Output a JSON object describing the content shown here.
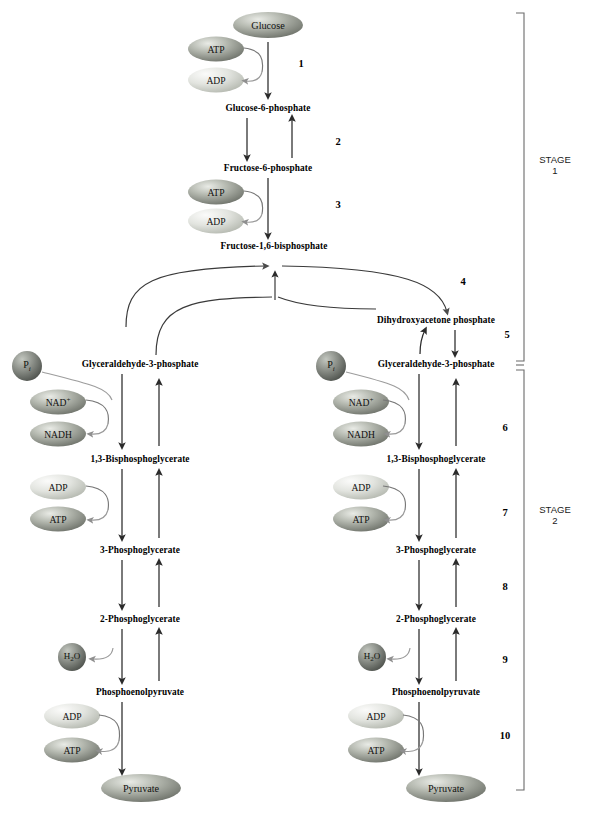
{
  "figure": {
    "stages": [
      {
        "label": "STAGE",
        "number": "1"
      },
      {
        "label": "STAGE",
        "number": "2"
      }
    ],
    "step_numbers": [
      "1",
      "2",
      "3",
      "4",
      "5",
      "6",
      "7",
      "8",
      "9",
      "10"
    ]
  },
  "colors": {
    "line": "#3a3a3a",
    "arrow": "#2b2b2b",
    "bracket": "#6b6b6b",
    "bubble_light_a": "#f2f2f2",
    "bubble_light_b": "#b9bdb4",
    "bubble_dark_a": "#d8dad4",
    "bubble_dark_b": "#6f736a",
    "circle_a": "#9aa09a",
    "circle_b": "#4e524d",
    "text": "#000000"
  },
  "metabolites": {
    "glucose": "Glucose",
    "g6p": "Glucose-6-phosphate",
    "f6p": "Fructose-6-phosphate",
    "f16bp": "Fructose-1,6-bisphosphate",
    "dhap": "Dihydroxyacetone phosphate",
    "g3p": "Glyceraldehyde-3-phosphate",
    "bpg13": "1,3-Bisphosphoglycerate",
    "pg3": "3-Phosphoglycerate",
    "pg2": "2-Phosphoglycerate",
    "pep": "Phosphoenolpyruvate",
    "pyruvate": "Pyruvate"
  },
  "cofactors": {
    "atp": "ATP",
    "adp": "ADP",
    "nad_plus": "NAD+",
    "nadh": "NADH",
    "pi": "Pi",
    "water": "H2O"
  },
  "upper_chain": [
    {
      "id": "glucose",
      "name": "Glucose",
      "kind": "bubble",
      "x": 268,
      "y": 25,
      "rx": 35,
      "ry": 13,
      "shade": "dark"
    },
    {
      "id": "g6p",
      "name": "Glucose-6-phosphate",
      "kind": "text",
      "x": 268,
      "y": 108
    },
    {
      "id": "f6p",
      "name": "Fructose-6-phosphate",
      "kind": "text",
      "x": 268,
      "y": 168
    },
    {
      "id": "f16bp",
      "name": "Fructose-1,6-bisphosphate",
      "kind": "text",
      "x": 274,
      "y": 246
    }
  ],
  "branch": {
    "dhap": {
      "name": "Dihydroxyacetone phosphate",
      "x": 436,
      "y": 320
    },
    "g3p_left": {
      "name": "Glyceraldehyde-3-phosphate",
      "x": 140,
      "y": 364
    },
    "g3p_right": {
      "name": "Glyceraldehyde-3-phosphate",
      "x": 436,
      "y": 364
    }
  },
  "lower_chain_left": [
    {
      "id": "bpg13",
      "name": "1,3-Bisphosphoglycerate",
      "x": 140,
      "y": 459
    },
    {
      "id": "pg3",
      "name": "3-Phosphoglycerate",
      "x": 140,
      "y": 550
    },
    {
      "id": "pg2",
      "name": "2-Phosphoglycerate",
      "x": 140,
      "y": 619
    },
    {
      "id": "pep",
      "name": "Phosphoenolpyruvate",
      "x": 140,
      "y": 692
    },
    {
      "id": "pyruvate",
      "name": "Pyruvate",
      "x": 141,
      "y": 788
    }
  ],
  "lower_chain_right": [
    {
      "id": "bpg13",
      "name": "1,3-Bisphosphoglycerate",
      "x": 436,
      "y": 459
    },
    {
      "id": "pg3",
      "name": "3-Phosphoglycerate",
      "x": 436,
      "y": 550
    },
    {
      "id": "pg2",
      "name": "2-Phosphoglycerate",
      "x": 436,
      "y": 619
    },
    {
      "id": "pep",
      "name": "Phosphoenolpyruvate",
      "x": 436,
      "y": 692
    },
    {
      "id": "pyruvate",
      "name": "Pyruvate",
      "x": 446,
      "y": 788
    }
  ],
  "bubbles": [
    {
      "id": "atp-1",
      "label": "ATP",
      "x": 216,
      "y": 49,
      "shade": "dark"
    },
    {
      "id": "adp-1",
      "label": "ADP",
      "x": 216,
      "y": 80,
      "shade": "light"
    },
    {
      "id": "atp-3",
      "label": "ATP",
      "x": 216,
      "y": 192,
      "shade": "dark"
    },
    {
      "id": "adp-3",
      "label": "ADP",
      "x": 216,
      "y": 221,
      "shade": "light"
    },
    {
      "id": "nadp-L",
      "label": "NAD+",
      "x": 58,
      "y": 402,
      "shade": "dark"
    },
    {
      "id": "nadh-L",
      "label": "NADH",
      "x": 58,
      "y": 434,
      "shade": "dark"
    },
    {
      "id": "adp-L7",
      "label": "ADP",
      "x": 58,
      "y": 487,
      "shade": "light"
    },
    {
      "id": "atp-L7",
      "label": "ATP",
      "x": 58,
      "y": 519,
      "shade": "dark"
    },
    {
      "id": "adp-L10",
      "label": "ADP",
      "x": 72,
      "y": 716,
      "shade": "light"
    },
    {
      "id": "atp-L10",
      "label": "ATP",
      "x": 72,
      "y": 750,
      "shade": "dark"
    },
    {
      "id": "nadp-R",
      "label": "NAD+",
      "x": 361,
      "y": 402,
      "shade": "dark"
    },
    {
      "id": "nadh-R",
      "label": "NADH",
      "x": 361,
      "y": 434,
      "shade": "dark"
    },
    {
      "id": "adp-R7",
      "label": "ADP",
      "x": 361,
      "y": 487,
      "shade": "light"
    },
    {
      "id": "atp-R7",
      "label": "ATP",
      "x": 361,
      "y": 519,
      "shade": "dark"
    },
    {
      "id": "adp-R10",
      "label": "ADP",
      "x": 376,
      "y": 716,
      "shade": "light"
    },
    {
      "id": "atp-R10",
      "label": "ATP",
      "x": 376,
      "y": 750,
      "shade": "dark"
    }
  ],
  "circles": [
    {
      "id": "pi-left",
      "label": "Pi",
      "x": 27,
      "y": 366,
      "r": 15
    },
    {
      "id": "pi-right",
      "label": "Pi",
      "x": 331,
      "y": 366,
      "r": 15
    },
    {
      "id": "h2o-left",
      "label": "H2O",
      "x": 72,
      "y": 657,
      "r": 14
    },
    {
      "id": "h2o-right",
      "label": "H2O",
      "x": 372,
      "y": 657,
      "r": 14
    }
  ],
  "step_label_positions": [
    {
      "n": "1",
      "x": 301,
      "y": 63
    },
    {
      "n": "2",
      "x": 338,
      "y": 141
    },
    {
      "n": "3",
      "x": 338,
      "y": 204
    },
    {
      "n": "4",
      "x": 463,
      "y": 281
    },
    {
      "n": "5",
      "x": 507,
      "y": 334
    },
    {
      "n": "6",
      "x": 505,
      "y": 427
    },
    {
      "n": "7",
      "x": 505,
      "y": 512
    },
    {
      "n": "8",
      "x": 505,
      "y": 586
    },
    {
      "n": "9",
      "x": 505,
      "y": 659
    },
    {
      "n": "10",
      "x": 505,
      "y": 735
    }
  ],
  "stage_label_positions": [
    {
      "label": "STAGE",
      "number": "1",
      "x": 555,
      "y": 165
    },
    {
      "label": "STAGE",
      "number": "2",
      "x": 555,
      "y": 515
    }
  ]
}
